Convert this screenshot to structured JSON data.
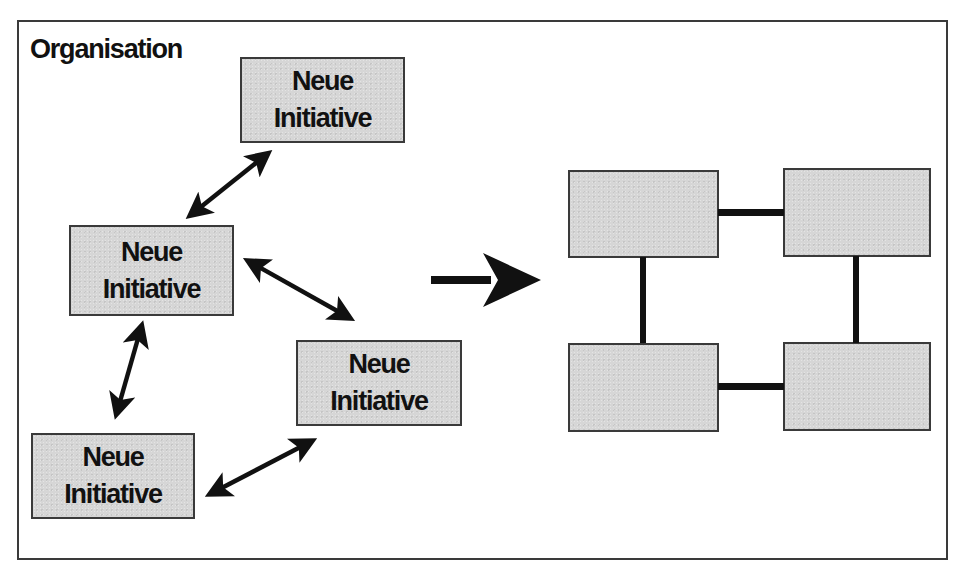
{
  "diagram": {
    "title": "Organisation",
    "initiatives": [
      {
        "line1": "Neue",
        "line2": "Initiative"
      },
      {
        "line1": "Neue",
        "line2": "Initiative"
      },
      {
        "line1": "Neue",
        "line2": "Initiative"
      },
      {
        "line1": "Neue",
        "line2": "Initiative"
      }
    ],
    "structure": {
      "boxes": 4,
      "connectors": [
        "top",
        "left",
        "right",
        "bottom"
      ]
    },
    "transition_arrow": "right-arrow",
    "colors": {
      "box_fill": "#d6d6d6",
      "stroke": "#111111",
      "frame": "#3a3a3a",
      "background": "#ffffff"
    }
  }
}
